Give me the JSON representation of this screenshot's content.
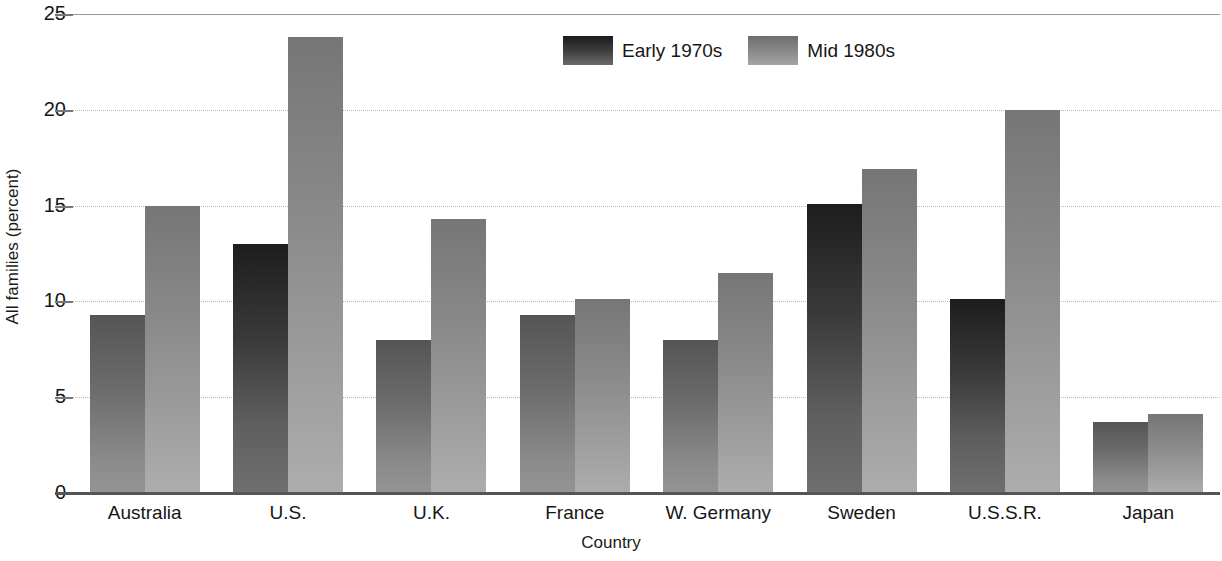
{
  "chart_data": {
    "type": "bar",
    "title": "",
    "xlabel": "Country",
    "ylabel": "All families (percent)",
    "categories": [
      "Australia",
      "U.S.",
      "U.K.",
      "France",
      "W. Germany",
      "Sweden",
      "U.S.S.R.",
      "Japan"
    ],
    "series": [
      {
        "name": "Early 1970s",
        "color": "#3a3a3a",
        "values": [
          9.3,
          13.0,
          8.0,
          9.3,
          8.0,
          15.1,
          10.1,
          3.7
        ]
      },
      {
        "name": "Mid 1980s",
        "color": "#8f8f8f",
        "values": [
          15.0,
          23.8,
          14.3,
          10.1,
          11.5,
          16.9,
          20.0,
          4.1
        ]
      }
    ],
    "ylim": [
      0,
      25
    ],
    "yticks": [
      0,
      5,
      10,
      15,
      20,
      25
    ],
    "ytick_labels": [
      "0",
      "5",
      "10",
      "15",
      "20",
      "25"
    ],
    "grid": true,
    "grid_axis": "y",
    "legend_position": "top-center"
  },
  "axes": {
    "y_title": "All families (percent)",
    "x_title": "Country"
  },
  "legend": {
    "items": [
      {
        "label": "Early 1970s",
        "swatch": "legend-swatch-early-1970s"
      },
      {
        "label": "Mid 1980s",
        "swatch": "legend-swatch-mid-1980s"
      }
    ]
  }
}
